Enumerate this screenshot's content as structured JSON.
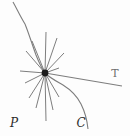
{
  "figure": {
    "labels": {
      "point": "P",
      "curve": "C",
      "tangent": "T"
    },
    "colors": {
      "line": "#7d7d7d",
      "dot": "#1c1c1c",
      "label_dark": "#2b2b2b",
      "label_gray": "#6f6f6f",
      "background": "#fdfdfd"
    },
    "geometry": {
      "dot": {
        "x": 45,
        "y": 73,
        "r": 3.4
      },
      "tangent": {
        "x1": 45,
        "y1": 73,
        "x2": 122,
        "y2": 86
      },
      "curve_top_d": "M 13,2 C 17,9 20,16 25,24",
      "curve_main_d": "M 25,24 C 29,34 32,44 36,55 C 40,65 42,69 45,73 C 50,78 56,81 63,85 C 71,90 77,96 81,104 C 84,110 87,119 88,129",
      "radial_arrows": [
        {
          "x": 46,
          "y": 32
        },
        {
          "x": 57,
          "y": 38
        },
        {
          "x": 64,
          "y": 53
        },
        {
          "x": 59,
          "y": 68
        },
        {
          "x": 32,
          "y": 41
        },
        {
          "x": 26,
          "y": 51
        },
        {
          "x": 20,
          "y": 71
        },
        {
          "x": 25,
          "y": 83
        },
        {
          "x": 29,
          "y": 98
        },
        {
          "x": 36,
          "y": 108
        },
        {
          "x": 46,
          "y": 121
        },
        {
          "x": 53,
          "y": 110
        },
        {
          "x": 59,
          "y": 97
        }
      ],
      "label_positions": {
        "point": {
          "x": 14,
          "y": 127
        },
        "curve": {
          "x": 81,
          "y": 127
        },
        "tangent": {
          "x": 115,
          "y": 77
        }
      }
    }
  }
}
